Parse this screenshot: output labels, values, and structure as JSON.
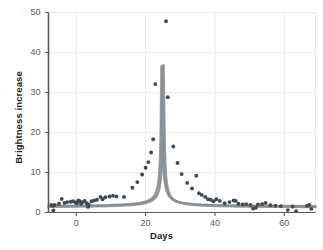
{
  "figure": {
    "background": "#ffffff",
    "axis_color": "#58595b",
    "grid_color": "#e9e9e9",
    "marker_color": "#3f4a52",
    "curve_color": "#8e9398",
    "curve_outline": "#6d7276"
  },
  "axes": {
    "x_title": "Days",
    "y_title": "Brightness increase",
    "x_ticks": [
      "0",
      "20",
      "40",
      "60"
    ],
    "x_tick_values": [
      0,
      20,
      40,
      60
    ],
    "y_ticks": [
      "0",
      "10",
      "20",
      "30",
      "40",
      "50"
    ],
    "y_tick_values": [
      0,
      10,
      20,
      30,
      40,
      50
    ]
  },
  "chart_data": {
    "type": "scatter",
    "title": "",
    "subtitle": "",
    "xlabel": "Days",
    "ylabel": "Brightness increase",
    "xlim": [
      -8,
      69
    ],
    "ylim": [
      0,
      50
    ],
    "grid": true,
    "legend": null,
    "series": [
      {
        "name": "Observed brightness",
        "type": "scatter",
        "marker": "circle",
        "color": "#3f4a52",
        "points": [
          [
            -7.2,
            1.9
          ],
          [
            -6.8,
            1.7
          ],
          [
            -6.6,
            0.5
          ],
          [
            -6.2,
            1.9
          ],
          [
            -5.0,
            2.2
          ],
          [
            -4.2,
            3.4
          ],
          [
            -3.4,
            2.4
          ],
          [
            -2.6,
            2.6
          ],
          [
            -1.6,
            2.7
          ],
          [
            -0.9,
            2.8
          ],
          [
            -0.2,
            2.5
          ],
          [
            0.2,
            2.3
          ],
          [
            0.6,
            3.0
          ],
          [
            1.0,
            2.8
          ],
          [
            1.4,
            2.2
          ],
          [
            1.8,
            2.6
          ],
          [
            2.4,
            2.9
          ],
          [
            3.0,
            2.3
          ],
          [
            3.4,
            1.4
          ],
          [
            3.6,
            2.0
          ],
          [
            4.4,
            2.8
          ],
          [
            5.2,
            3.0
          ],
          [
            6.0,
            3.2
          ],
          [
            7.0,
            3.9
          ],
          [
            7.6,
            3.3
          ],
          [
            8.4,
            3.8
          ],
          [
            9.6,
            4.0
          ],
          [
            10.6,
            4.2
          ],
          [
            11.6,
            4.0
          ],
          [
            13.8,
            3.9
          ],
          [
            16.2,
            6.2
          ],
          [
            17.6,
            7.6
          ],
          [
            19.0,
            9.5
          ],
          [
            20.0,
            11.2
          ],
          [
            20.8,
            12.6
          ],
          [
            21.6,
            15.0
          ],
          [
            22.2,
            18.3
          ],
          [
            22.8,
            32.1
          ],
          [
            25.9,
            47.8
          ],
          [
            26.4,
            28.8
          ],
          [
            28.0,
            16.5
          ],
          [
            29.2,
            12.4
          ],
          [
            30.4,
            9.6
          ],
          [
            32.0,
            7.4
          ],
          [
            33.4,
            6.0
          ],
          [
            34.6,
            9.2
          ],
          [
            35.4,
            4.8
          ],
          [
            36.2,
            4.4
          ],
          [
            37.2,
            3.9
          ],
          [
            38.0,
            3.3
          ],
          [
            38.8,
            3.2
          ],
          [
            39.6,
            2.8
          ],
          [
            40.4,
            3.3
          ],
          [
            41.4,
            2.9
          ],
          [
            42.8,
            2.3
          ],
          [
            44.2,
            2.6
          ],
          [
            45.4,
            3.0
          ],
          [
            46.0,
            2.9
          ],
          [
            46.8,
            2.2
          ],
          [
            48.0,
            2.0
          ],
          [
            49.0,
            2.1
          ],
          [
            50.2,
            1.9
          ],
          [
            51.0,
            1.0
          ],
          [
            51.8,
            1.2
          ],
          [
            52.4,
            2.0
          ],
          [
            53.6,
            2.1
          ],
          [
            54.6,
            2.4
          ],
          [
            56.0,
            1.8
          ],
          [
            57.4,
            1.7
          ],
          [
            59.0,
            1.6
          ],
          [
            61.0,
            0.6
          ],
          [
            62.4,
            1.5
          ],
          [
            63.4,
            0.3
          ],
          [
            66.6,
            1.7
          ],
          [
            67.2,
            1.9
          ],
          [
            67.8,
            0.9
          ]
        ]
      },
      {
        "name": "Fitted model (upper)",
        "type": "line",
        "color": "#8e9398",
        "peak_day": 24.9,
        "baseline": 1.5
      },
      {
        "name": "Fitted model (lower)",
        "type": "line",
        "color": "#8e9398",
        "peak_day": 24.9,
        "baseline": 1.3
      }
    ]
  }
}
